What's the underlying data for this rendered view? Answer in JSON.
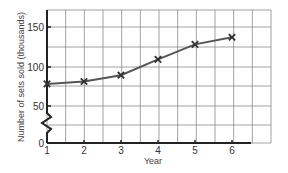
{
  "chart_data": {
    "type": "line",
    "title": "",
    "xlabel": "Year",
    "ylabel": "Number of sets sold (thousands)",
    "categories": [
      "1",
      "2",
      "3",
      "4",
      "5",
      "6"
    ],
    "x": [
      1,
      2,
      3,
      4,
      5,
      6
    ],
    "series": [
      {
        "name": "Sets sold",
        "values": [
          78,
          81,
          89,
          109,
          128,
          137
        ],
        "marker": "x",
        "color": "#555555"
      }
    ],
    "y_ticks": [
      "0",
      "50",
      "100",
      "150"
    ],
    "x_ticks": [
      "1",
      "2",
      "3",
      "4",
      "5",
      "6"
    ],
    "ylim": [
      0,
      175
    ],
    "xlim": [
      1,
      7.2
    ],
    "grid": true,
    "axis_break": true,
    "legend": null
  }
}
